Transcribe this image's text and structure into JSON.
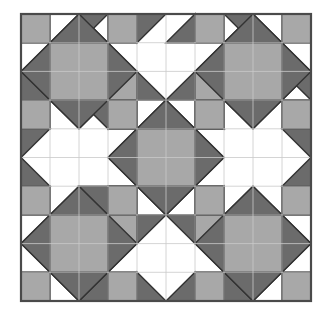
{
  "figure": {
    "canvas": {
      "width": 331,
      "height": 316
    },
    "frame": {
      "x": 21,
      "y": 14,
      "width": 290,
      "height": 287
    },
    "grid": {
      "cols": 10,
      "rows": 10,
      "cell_w": 29,
      "cell_h": 28.7,
      "visible": true
    }
  },
  "colors": {
    "background": "#ffffff",
    "patch_white": "#ffffff",
    "patch_light": "#a8a8a8",
    "patch_dark": "#6b6b6b",
    "outline": "#333333",
    "grid_line": "#c9c9c9",
    "frame_border": "#4a4a4a"
  },
  "legend": {
    "entries": [
      {
        "name": "white-patch",
        "label": "White",
        "color": "#ffffff"
      },
      {
        "name": "light-gray-patch",
        "label": "Light Gray",
        "color": "#a8a8a8"
      },
      {
        "name": "dark-gray-patch",
        "label": "Dark Gray",
        "color": "#6b6b6b"
      }
    ]
  },
  "chart_data": {
    "type": "table",
    "xlabel": "",
    "ylabel": "",
    "grid": true,
    "categories": [
      "col0",
      "col1",
      "col2",
      "col3",
      "col4",
      "col5",
      "col6",
      "col7",
      "col8",
      "col9"
    ],
    "motifs": [
      {
        "name": "star-block-top-left",
        "origin": [
          0,
          0
        ],
        "size": [
          4,
          4
        ]
      },
      {
        "name": "star-block-top-right",
        "origin": [
          6,
          0
        ],
        "size": [
          4,
          4
        ]
      },
      {
        "name": "star-block-bottom-left",
        "origin": [
          0,
          6
        ],
        "size": [
          4,
          4
        ]
      },
      {
        "name": "star-block-bottom-right",
        "origin": [
          6,
          6
        ],
        "size": [
          4,
          4
        ]
      },
      {
        "name": "star-block-center",
        "origin": [
          3,
          3
        ],
        "size": [
          4,
          4
        ]
      },
      {
        "name": "pinwheel-top",
        "origin": [
          4,
          0
        ],
        "size": [
          2,
          2
        ]
      },
      {
        "name": "pinwheel-bottom",
        "origin": [
          4,
          8
        ],
        "size": [
          2,
          2
        ]
      },
      {
        "name": "pinwheel-left",
        "origin": [
          0,
          4
        ],
        "size": [
          2,
          2
        ]
      },
      {
        "name": "pinwheel-right",
        "origin": [
          8,
          4
        ],
        "size": [
          2,
          2
        ]
      }
    ],
    "patches": [
      {
        "shape": "rect",
        "fill": "light",
        "x": 0,
        "y": 0,
        "w": 1,
        "h": 1
      },
      {
        "shape": "tri",
        "fill": "dark",
        "pts": [
          [
            1,
            0
          ],
          [
            2,
            0
          ],
          [
            2,
            1
          ]
        ]
      },
      {
        "shape": "tri",
        "fill": "dark",
        "pts": [
          [
            2,
            0
          ],
          [
            3,
            0
          ],
          [
            2,
            1
          ]
        ]
      },
      {
        "shape": "rect",
        "fill": "light",
        "x": 3,
        "y": 0,
        "w": 1,
        "h": 1
      },
      {
        "shape": "tri",
        "fill": "dark",
        "pts": [
          [
            4,
            0
          ],
          [
            5,
            0
          ],
          [
            4,
            1
          ]
        ]
      },
      {
        "shape": "tri",
        "fill": "dark",
        "pts": [
          [
            5,
            1
          ],
          [
            6,
            0
          ],
          [
            6,
            1
          ]
        ]
      },
      {
        "shape": "rect",
        "fill": "light",
        "x": 6,
        "y": 0,
        "w": 1,
        "h": 1
      },
      {
        "shape": "tri",
        "fill": "dark",
        "pts": [
          [
            7,
            0
          ],
          [
            8,
            0
          ],
          [
            8,
            1
          ]
        ]
      },
      {
        "shape": "tri",
        "fill": "dark",
        "pts": [
          [
            8,
            0
          ],
          [
            9,
            0
          ],
          [
            8,
            1
          ]
        ]
      },
      {
        "shape": "rect",
        "fill": "light",
        "x": 9,
        "y": 0,
        "w": 1,
        "h": 1
      },
      {
        "shape": "tri",
        "fill": "dark",
        "pts": [
          [
            0,
            1
          ],
          [
            1,
            1
          ],
          [
            0,
            2
          ]
        ]
      },
      {
        "shape": "tri",
        "fill": "dark",
        "pts": [
          [
            1,
            1
          ],
          [
            0,
            2
          ],
          [
            1,
            2
          ]
        ]
      },
      {
        "shape": "rect",
        "fill": "light",
        "x": 1,
        "y": 1,
        "w": 2,
        "h": 2
      },
      {
        "shape": "tri",
        "fill": "dark",
        "pts": [
          [
            3,
            1
          ],
          [
            4,
            1
          ],
          [
            4,
            2
          ]
        ]
      },
      {
        "shape": "tri",
        "fill": "dark",
        "pts": [
          [
            3,
            1
          ],
          [
            3,
            2
          ],
          [
            4,
            2
          ]
        ]
      },
      {
        "shape": "tri",
        "fill": "dark",
        "pts": [
          [
            6,
            1
          ],
          [
            7,
            1
          ],
          [
            6,
            2
          ]
        ]
      },
      {
        "shape": "tri",
        "fill": "dark",
        "pts": [
          [
            6,
            2
          ],
          [
            7,
            1
          ],
          [
            7,
            2
          ]
        ]
      },
      {
        "shape": "rect",
        "fill": "light",
        "x": 7,
        "y": 1,
        "w": 2,
        "h": 2
      },
      {
        "shape": "tri",
        "fill": "dark",
        "pts": [
          [
            9,
            1
          ],
          [
            10,
            1
          ],
          [
            10,
            2
          ]
        ]
      },
      {
        "shape": "tri",
        "fill": "dark",
        "pts": [
          [
            9,
            1
          ],
          [
            9,
            2
          ],
          [
            10,
            2
          ]
        ]
      },
      {
        "shape": "rect",
        "fill": "light",
        "x": 0,
        "y": 3,
        "w": 1,
        "h": 1
      },
      {
        "shape": "tri",
        "fill": "dark",
        "pts": [
          [
            1,
            3
          ],
          [
            2,
            3
          ],
          [
            1,
            4
          ]
        ]
      },
      {
        "shape": "tri",
        "fill": "dark",
        "pts": [
          [
            2,
            3
          ],
          [
            3,
            3
          ],
          [
            2,
            4
          ]
        ]
      },
      {
        "shape": "rect",
        "fill": "light",
        "x": 3,
        "y": 3,
        "w": 1,
        "h": 1
      },
      {
        "shape": "rect",
        "fill": "light",
        "x": 6,
        "y": 3,
        "w": 1,
        "h": 1
      },
      {
        "shape": "tri",
        "fill": "dark",
        "pts": [
          [
            7,
            3
          ],
          [
            8,
            3
          ],
          [
            7,
            4
          ]
        ]
      },
      {
        "shape": "tri",
        "fill": "dark",
        "pts": [
          [
            8,
            3
          ],
          [
            9,
            3
          ],
          [
            8,
            4
          ]
        ]
      },
      {
        "shape": "rect",
        "fill": "light",
        "x": 9,
        "y": 3,
        "w": 1,
        "h": 1
      },
      {
        "shape": "tri",
        "fill": "dark",
        "pts": [
          [
            0,
            4
          ],
          [
            1,
            4
          ],
          [
            0,
            5
          ]
        ]
      },
      {
        "shape": "tri",
        "fill": "dark",
        "pts": [
          [
            3,
            4
          ],
          [
            4,
            3
          ],
          [
            4,
            4
          ]
        ]
      },
      {
        "shape": "rect",
        "fill": "light",
        "x": 3,
        "y": 3,
        "w": 1,
        "h": 1
      },
      {
        "shape": "diamond",
        "fill": "dark",
        "cx": 5,
        "cy": 5,
        "r": 2
      },
      {
        "shape": "rect",
        "fill": "light",
        "x": 4,
        "y": 4,
        "w": 2,
        "h": 2
      },
      {
        "shape": "tri",
        "fill": "dark",
        "pts": [
          [
            9,
            4
          ],
          [
            10,
            4
          ],
          [
            10,
            5
          ]
        ]
      },
      {
        "shape": "rect",
        "fill": "light",
        "x": 0,
        "y": 6,
        "w": 1,
        "h": 1
      },
      {
        "shape": "rect",
        "fill": "light",
        "x": 9,
        "y": 6,
        "w": 1,
        "h": 1
      },
      {
        "shape": "tri",
        "fill": "dark",
        "pts": [
          [
            0,
            7
          ],
          [
            1,
            7
          ],
          [
            0,
            8
          ]
        ]
      },
      {
        "shape": "rect",
        "fill": "light",
        "x": 1,
        "y": 7,
        "w": 2,
        "h": 2
      },
      {
        "shape": "rect",
        "fill": "light",
        "x": 7,
        "y": 7,
        "w": 2,
        "h": 2
      },
      {
        "shape": "rect",
        "fill": "light",
        "x": 0,
        "y": 9,
        "w": 1,
        "h": 1
      },
      {
        "shape": "rect",
        "fill": "light",
        "x": 3,
        "y": 9,
        "w": 1,
        "h": 1
      },
      {
        "shape": "rect",
        "fill": "light",
        "x": 6,
        "y": 9,
        "w": 1,
        "h": 1
      },
      {
        "shape": "rect",
        "fill": "light",
        "x": 9,
        "y": 9,
        "w": 1,
        "h": 1
      }
    ]
  }
}
